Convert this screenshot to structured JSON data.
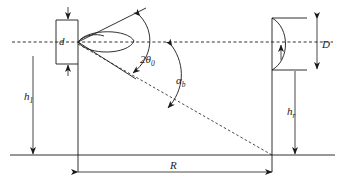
{
  "figure": {
    "kind": "technical-line-diagram",
    "background_color": "#ffffff",
    "line_color": "#1a1a1a"
  },
  "labels": {
    "feed_aperture": {
      "symbol": "d",
      "subscript": "",
      "meaning": "feed aperture dimension"
    },
    "beamwidth": {
      "symbol": "2θ",
      "subscript": "0",
      "meaning": "total beamwidth two theta zero"
    },
    "beam_tilt": {
      "symbol": "α",
      "subscript": "b",
      "meaning": "beam tilt angle alpha b"
    },
    "transmit_height": {
      "symbol": "h",
      "subscript": "1",
      "meaning": "transmitter antenna height"
    },
    "receive_height": {
      "symbol": "h",
      "subscript": "r",
      "meaning": "receiver antenna height"
    },
    "reflector_diameter": {
      "symbol": "D",
      "subscript": "",
      "meaning": "reflector aperture diameter"
    },
    "range": {
      "symbol": "R",
      "subscript": "",
      "meaning": "horizontal range between antennas"
    }
  },
  "elements": {
    "boresight_axis": "horizontal dashed centre line",
    "ground_line": "solid horizontal baseline",
    "main_lobe": "elliptical radiation lobe at feed",
    "beam_edge_upper": "solid beam edge sloping up-right",
    "beam_edge_lower": "solid beam edge sloping down-right",
    "slant_path": "dashed line from feed to ground at range R",
    "reflector": "parabolic dish curve at right",
    "feed_box": "rectangular feed structure at left"
  }
}
